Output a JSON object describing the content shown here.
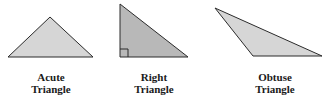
{
  "diagram": {
    "colors": {
      "stroke": "#2b2b2b",
      "acute_fill": "#d6d6d6",
      "right_fill": "#b8b8b8",
      "obtuse_fill": "#d6d6d6"
    },
    "triangles": [
      {
        "type": "acute",
        "label_line1": "Acute",
        "label_line2": "Triangle",
        "points": "8,57 50,17 93,57"
      },
      {
        "type": "right",
        "label_line1": "Right",
        "label_line2": "Triangle",
        "points": "120,4 120,57 188,57",
        "right_angle_marker": true
      },
      {
        "type": "obtuse",
        "label_line1": "Obtuse",
        "label_line2": "Triangle",
        "points": "215,8 253,56 322,56"
      }
    ]
  }
}
